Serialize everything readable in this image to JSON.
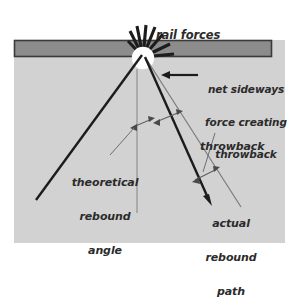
{
  "diagram": {
    "colors": {
      "page_background": "#ffffff",
      "ground_field": "#d2d2d2",
      "rail_fill": "#8c8c8c",
      "rail_border": "#3a3a3a",
      "impact_circle": "#ffffff",
      "thick_line": "#1c1c1c",
      "thin_line": "#6e6e6e",
      "text": "#2b2b2b"
    },
    "labels": {
      "rail_forces": "rail forces",
      "net_sideways": {
        "line1": "net sideways",
        "line2": "force creating",
        "line3": "throwback"
      },
      "throwback": "throwback",
      "theoretical": {
        "line1": "theoretical",
        "line2": "rebound",
        "line3": "angle"
      },
      "actual": {
        "line1": "actual",
        "line2": "rebound",
        "line3": "path"
      }
    },
    "geometry": {
      "field": {
        "x": 14,
        "y": 40,
        "width": 271,
        "height": 203
      },
      "rail": {
        "x": 14,
        "y": 40,
        "width": 258,
        "height": 17
      },
      "impact_point": {
        "x": 143,
        "y": 57,
        "radius": 11
      },
      "starburst_ray_count": 8,
      "net_force_arrow": {
        "from_x": 197,
        "from_y": 75,
        "to_x": 163,
        "to_y": 75,
        "direction": "left"
      },
      "theoretical_rebound_left": {
        "x1": 143,
        "y1": 57,
        "x2": 36,
        "y2": 200
      },
      "theoretical_rebound_right": {
        "x1": 146,
        "y1": 60,
        "x2": 240,
        "y2": 205
      },
      "normal_line": {
        "x1": 137,
        "y1": 68,
        "x2": 137,
        "y2": 212
      },
      "actual_rebound_path": {
        "x1": 146,
        "y1": 60,
        "x2": 210,
        "y2": 202
      },
      "throwback_span_upper": {
        "x1": 157,
        "y1": 121,
        "x2": 179,
        "y2": 113
      },
      "throwback_span_lower": {
        "x1": 196,
        "y1": 178,
        "x2": 216,
        "y2": 168
      }
    }
  }
}
